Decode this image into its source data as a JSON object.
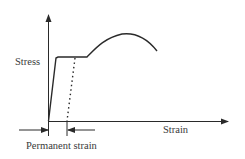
{
  "diagram": {
    "type": "stress-strain curve",
    "y_axis_label": "Stress",
    "x_axis_label": "Strain",
    "annotation": "Permanent strain",
    "colors": {
      "line": "#2a2a2a",
      "text": "#3a3a3a",
      "background": "#ffffff"
    }
  }
}
